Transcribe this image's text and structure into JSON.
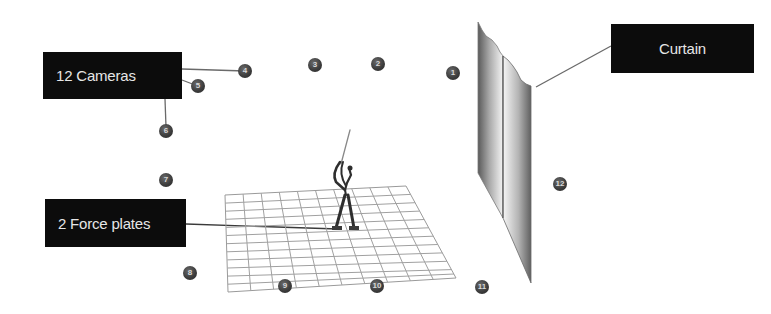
{
  "labels": {
    "cameras": "12 Cameras",
    "curtain": "Curtain",
    "force_plates": "2 Force plates"
  },
  "camera_markers": [
    {
      "id": "1",
      "x": 453,
      "y": 73
    },
    {
      "id": "2",
      "x": 384,
      "y": 64
    },
    {
      "id": "3",
      "x": 319,
      "y": 65
    },
    {
      "id": "4",
      "x": 250,
      "y": 71
    },
    {
      "id": "5",
      "x": 199,
      "y": 86
    },
    {
      "id": "6",
      "x": 167,
      "y": 132
    },
    {
      "id": "7",
      "x": 166,
      "y": 180
    },
    {
      "id": "8",
      "x": 191,
      "y": 273
    },
    {
      "id": "9",
      "x": 287,
      "y": 286
    },
    {
      "id": "10",
      "x": 379,
      "y": 286
    },
    {
      "id": "11",
      "x": 483,
      "y": 287
    },
    {
      "id": "12",
      "x": 562,
      "y": 184
    }
  ],
  "colors": {
    "label_bg": "#0c0c0c",
    "label_text": "#e6e6e6",
    "marker": "#3a3a3a",
    "grid": "#9a9a9a",
    "figure": "#2e2e2e"
  }
}
